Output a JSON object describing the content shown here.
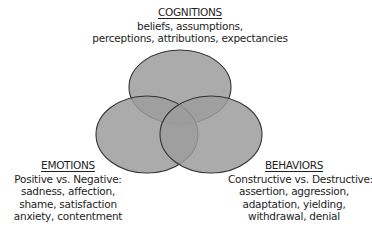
{
  "diagram": {
    "type": "venn",
    "colors": {
      "fill": "#9c9c9c",
      "fill_opacity": 0.85,
      "stroke": "#333333",
      "background": "#ffffff"
    },
    "sets": [
      {
        "id": "cognitions",
        "heading": "COGNITIONS",
        "lines": [
          "beliefs, assumptions,",
          "perceptions, attributions, expectancies"
        ]
      },
      {
        "id": "emotions",
        "heading": "EMOTIONS",
        "lines": [
          "Positive vs. Negative:",
          "sadness, affection,",
          "shame, satisfaction",
          "anxiety, contentment"
        ]
      },
      {
        "id": "behaviors",
        "heading": "BEHAVIORS",
        "lines": [
          "Constructive vs. Destructive:",
          "assertion, aggression,",
          "adaptation, yielding,",
          "withdrawal, denial"
        ]
      }
    ]
  }
}
